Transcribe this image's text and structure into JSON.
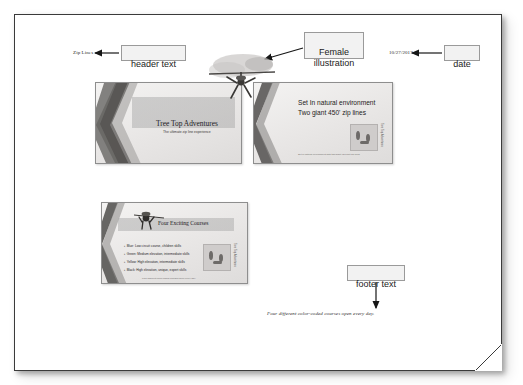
{
  "document": {
    "header_text": "Zip Lines",
    "date_text": "10/27/2017",
    "footer_text": "Four different color-coded courses open every day."
  },
  "callouts": [
    {
      "id": "header-text",
      "label": "header text"
    },
    {
      "id": "female-illustration",
      "label": "Female\nillustration"
    },
    {
      "id": "date",
      "label": "date"
    },
    {
      "id": "footer-text",
      "label": "footer text"
    }
  ],
  "slides": [
    {
      "id": "slide-title",
      "title": "Tree Top Adventures",
      "subtitle": "The ultimate zip line experience"
    },
    {
      "id": "slide-environment",
      "line1": "Set In natural environment",
      "line2": "Two giant 450' zip lines",
      "side_caption": "Tree Top Adventures",
      "fineprint": "Set in natural environment with two giant 450 foot zip lines"
    },
    {
      "id": "slide-courses",
      "title": "Four Exciting Courses",
      "bullets": [
        "Blue: Low circuit course, children skills",
        "Green: Medium elevation, intermediate skills",
        "Yellow: High elevation, intermediate skills",
        "Black: High elevation, unique, expert skills"
      ],
      "side_caption": "Tree Top Adventures",
      "fineprint": "Four different color-coded courses open every day."
    }
  ],
  "colors": {
    "page_bg": "#ffffff",
    "page_border": "#3a3a3a",
    "callout_bg": "#f2f2f2",
    "callout_border": "#9a9a9a",
    "arrow": "#161616",
    "slide_border": "#8e8e8e",
    "text": "#1b1b1b"
  }
}
